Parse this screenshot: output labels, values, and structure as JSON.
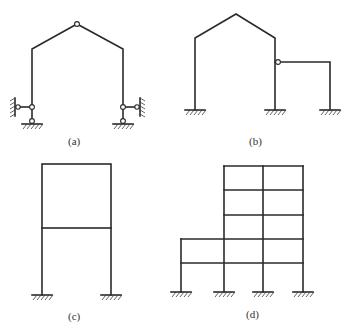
{
  "figures": [
    {
      "id": "a",
      "label": "(a)",
      "description": "Three-hinged gable frame with pinned supports and horizontal link bars to walls"
    },
    {
      "id": "b",
      "label": "(b)",
      "description": "Gable frame with fixed supports and attached single-bay frame via hinge"
    },
    {
      "id": "c",
      "label": "(c)",
      "description": "Two-storey single-bay rigid frame with fixed supports"
    },
    {
      "id": "d",
      "label": "(d)",
      "description": "Multi-storey multi-bay rigid frame, five storeys with two-storey left bay, fixed supports"
    }
  ],
  "colors": {
    "line": "#2a2a2a",
    "background": "#ffffff"
  }
}
